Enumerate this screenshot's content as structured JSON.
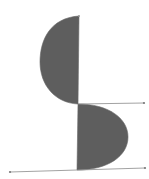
{
  "diagram": {
    "colors": {
      "fill": "#5e5e5e",
      "line": "#8a8a8a",
      "point": "#777777",
      "background": "#ffffff"
    },
    "upper_lobe": {
      "top": [
        79,
        16
      ],
      "bottom": [
        78,
        104
      ],
      "leftmost_x": 40
    },
    "lower_lobe": {
      "top": [
        78,
        104
      ],
      "bottom": [
        77,
        170
      ],
      "rightmost_x": 128
    },
    "lines": [
      {
        "from": [
          78,
          104
        ],
        "to": [
          144,
          103
        ]
      },
      {
        "from": [
          10,
          172
        ],
        "to": [
          145,
          168
        ]
      }
    ],
    "points": [
      [
        79,
        16
      ],
      [
        144,
        103
      ],
      [
        10,
        172
      ],
      [
        145,
        168
      ]
    ]
  }
}
